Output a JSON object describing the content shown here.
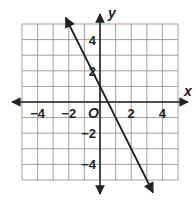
{
  "chart_data": {
    "type": "line",
    "title": "",
    "xlabel": "x",
    "ylabel": "y",
    "origin_label": "O",
    "xlim": [
      -5,
      5
    ],
    "ylim": [
      -5,
      5
    ],
    "grid": true,
    "grid_step": 1,
    "x_tick_labels": [
      "-4",
      "-2",
      "2",
      "4"
    ],
    "x_tick_values": [
      -4,
      -2,
      2,
      4
    ],
    "y_tick_labels": [
      "4",
      "2",
      "-2",
      "-4"
    ],
    "y_tick_values": [
      4,
      2,
      -2,
      -4
    ],
    "series": [
      {
        "name": "line",
        "equation": "y = -2x + 1",
        "slope": -2,
        "intercept": 1,
        "x": [
          -2,
          3
        ],
        "y": [
          5,
          -5
        ],
        "arrows": "both"
      }
    ]
  }
}
